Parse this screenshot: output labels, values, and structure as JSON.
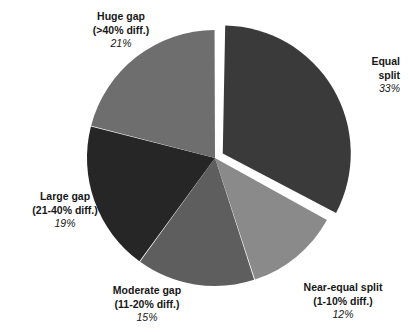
{
  "chart_data": {
    "type": "pie",
    "title": "",
    "subtitle": "",
    "xlabel": "",
    "ylabel": "",
    "legend_position": "none",
    "grid": false,
    "labels_inline": true,
    "start_angle_deg": 0,
    "direction": "clockwise",
    "exploded_slice": "Equal split",
    "categories": [
      "Equal split",
      "Near-equal split",
      "Moderate gap",
      "Large gap",
      "Huge gap"
    ],
    "values": [
      33,
      12,
      15,
      19,
      21
    ],
    "value_labels": [
      "33%",
      "12%",
      "15%",
      "19%",
      "21%"
    ],
    "sublabels": [
      "",
      "(1-10% diff.)",
      "(11-20% diff.)",
      "(21-40% diff.)",
      "(>40% diff.)"
    ],
    "colors": [
      "#3a3a3a",
      "#8a8a8a",
      "#5e5e5e",
      "#262626",
      "#6e6e6e"
    ],
    "total": 100,
    "units": "percent"
  },
  "slices": {
    "equal": {
      "name": "Equal split",
      "line1": "Equal",
      "line2": "split",
      "percent": "33%",
      "color": "#3a3a3a",
      "value": 33
    },
    "near_equal": {
      "name": "Near-equal split",
      "line1": "Near-equal split",
      "line2": "(1-10% diff.)",
      "percent": "12%",
      "color": "#8a8a8a",
      "value": 12
    },
    "moderate": {
      "name": "Moderate gap",
      "line1": "Moderate gap",
      "line2": "(11-20% diff.)",
      "percent": "15%",
      "color": "#5e5e5e",
      "value": 15
    },
    "large": {
      "name": "Large gap",
      "line1": "Large gap",
      "line2": "(21-40% diff.)",
      "percent": "19%",
      "color": "#262626",
      "value": 19
    },
    "huge": {
      "name": "Huge gap",
      "line1": "Huge gap",
      "line2": "(>40% diff.)",
      "percent": "21%",
      "color": "#6e6e6e",
      "value": 21
    }
  },
  "canvas": {
    "background": "#ffffff",
    "text_color": "#171717"
  }
}
